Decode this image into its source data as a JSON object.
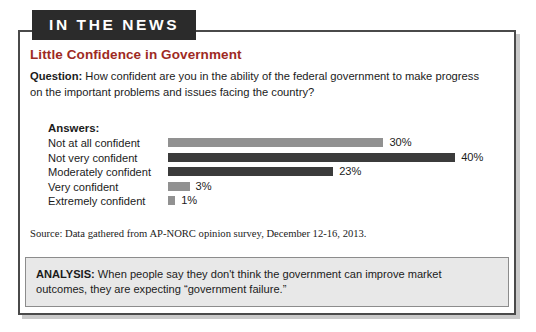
{
  "banner": {
    "label": "IN THE NEWS"
  },
  "headline": "Little Confidence in Government",
  "question": {
    "prefix": "Question:",
    "text": " How confident are you in the ability of the federal government to make progress on the important problems and issues facing the country?"
  },
  "answers": {
    "label": "Answers:"
  },
  "source": "Source: Data gathered from AP-NORC opinion survey, December 12-16, 2013.",
  "analysis": {
    "prefix": "ANALYSIS:",
    "text": " When people say they don't think the government can improve market outcomes, they are expecting “government failure.”"
  },
  "colors": {
    "headline": "#9e2a23",
    "banner_bg": "#2b2b2b",
    "bar_light": "#919191",
    "bar_dark": "#3b3b3b",
    "analysis_bg": "#e8e8e8",
    "card_border": "#4a4a4a"
  },
  "chart_data": {
    "type": "bar",
    "title": "Little Confidence in Government",
    "subtitle": "Question: How confident are you in the ability of the federal government to make progress on the important problems and issues facing the country?",
    "orientation": "horizontal",
    "xlabel": "",
    "ylabel": "Answers",
    "xlim": [
      0,
      40
    ],
    "grid": false,
    "legend": "none",
    "categories": [
      "Not at all confident",
      "Not very confident",
      "Moderately confident",
      "Very confident",
      "Extremely confident"
    ],
    "values": [
      30,
      40,
      23,
      3,
      1
    ],
    "value_labels": [
      "30%",
      "40%",
      "23%",
      "3%",
      "1%"
    ],
    "bar_colors": [
      "#919191",
      "#3b3b3b",
      "#3b3b3b",
      "#919191",
      "#919191"
    ],
    "source": "Source: Data gathered from AP-NORC opinion survey, December 12-16, 2013."
  }
}
